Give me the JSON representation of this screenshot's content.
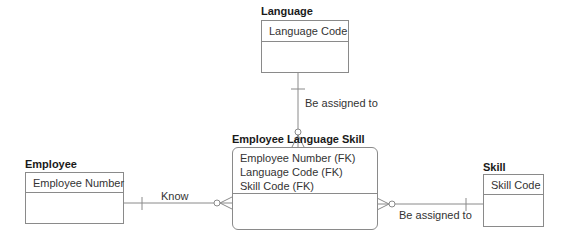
{
  "entities": {
    "language": {
      "title": "Language",
      "keys": [
        "Language Code"
      ]
    },
    "employee_language_skill": {
      "title": "Employee Language Skill",
      "keys": [
        "Employee Number (FK)",
        "Language Code (FK)",
        "Skill Code (FK)"
      ]
    },
    "employee": {
      "title": "Employee",
      "keys": [
        "Employee Number"
      ]
    },
    "skill": {
      "title": "Skill",
      "keys": [
        "Skill Code"
      ]
    }
  },
  "relationships": [
    {
      "from": "Language",
      "to": "Employee Language Skill",
      "label": "Be assigned to"
    },
    {
      "from": "Employee",
      "to": "Employee Language Skill",
      "label": "Know"
    },
    {
      "from": "Skill",
      "to": "Employee Language Skill",
      "label": "Be assigned to"
    }
  ],
  "colors": {
    "line": "#8a8a8a",
    "text": "#222222",
    "background": "#ffffff"
  }
}
